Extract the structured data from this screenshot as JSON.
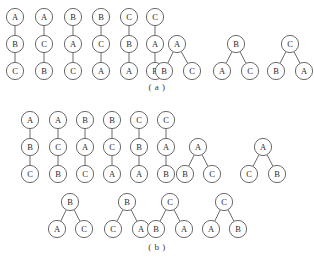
{
  "figure": {
    "node_radius": 8.6,
    "stroke_color": "#5a5a5a",
    "node_fill": "#ffffff",
    "label_color": "#2a2a2a",
    "background": "#ffffff",
    "panels": [
      {
        "id": "a",
        "caption": "( a )",
        "caption_y": 82,
        "trees": [
          {
            "name": "chain-abc",
            "shape": "chain",
            "nodes": [
              {
                "label": "A",
                "x": 15,
                "y": 17
              },
              {
                "label": "B",
                "x": 15,
                "y": 44
              },
              {
                "label": "C",
                "x": 15,
                "y": 71
              }
            ],
            "edges": [
              [
                0,
                1
              ],
              [
                1,
                2
              ]
            ]
          },
          {
            "name": "chain-acb",
            "shape": "chain",
            "nodes": [
              {
                "label": "A",
                "x": 44,
                "y": 17
              },
              {
                "label": "C",
                "x": 44,
                "y": 44
              },
              {
                "label": "B",
                "x": 44,
                "y": 71
              }
            ],
            "edges": [
              [
                0,
                1
              ],
              [
                1,
                2
              ]
            ]
          },
          {
            "name": "chain-bac",
            "shape": "chain",
            "nodes": [
              {
                "label": "B",
                "x": 73,
                "y": 17
              },
              {
                "label": "A",
                "x": 73,
                "y": 44
              },
              {
                "label": "C",
                "x": 73,
                "y": 71
              }
            ],
            "edges": [
              [
                0,
                1
              ],
              [
                1,
                2
              ]
            ]
          },
          {
            "name": "chain-bca",
            "shape": "chain",
            "nodes": [
              {
                "label": "B",
                "x": 101,
                "y": 17
              },
              {
                "label": "C",
                "x": 101,
                "y": 44
              },
              {
                "label": "A",
                "x": 101,
                "y": 71
              }
            ],
            "edges": [
              [
                0,
                1
              ],
              [
                1,
                2
              ]
            ]
          },
          {
            "name": "chain-cba",
            "shape": "chain",
            "nodes": [
              {
                "label": "C",
                "x": 129,
                "y": 17
              },
              {
                "label": "B",
                "x": 129,
                "y": 44
              },
              {
                "label": "A",
                "x": 129,
                "y": 71
              }
            ],
            "edges": [
              [
                0,
                1
              ],
              [
                1,
                2
              ]
            ]
          },
          {
            "name": "chain-cab",
            "shape": "chain",
            "nodes": [
              {
                "label": "C",
                "x": 155,
                "y": 17
              },
              {
                "label": "A",
                "x": 155,
                "y": 44
              },
              {
                "label": "B",
                "x": 155,
                "y": 71
              }
            ],
            "edges": [
              [
                0,
                1
              ],
              [
                1,
                2
              ]
            ]
          },
          {
            "name": "balanced-a-bc",
            "shape": "balanced",
            "nodes": [
              {
                "label": "A",
                "x": 177,
                "y": 44
              },
              {
                "label": "B",
                "x": 164,
                "y": 71
              },
              {
                "label": "C",
                "x": 192,
                "y": 71
              }
            ],
            "edges": [
              [
                0,
                1
              ],
              [
                0,
                2
              ]
            ]
          },
          {
            "name": "balanced-b-ac",
            "shape": "balanced",
            "nodes": [
              {
                "label": "B",
                "x": 236,
                "y": 44
              },
              {
                "label": "A",
                "x": 222,
                "y": 71
              },
              {
                "label": "C",
                "x": 250,
                "y": 71
              }
            ],
            "edges": [
              [
                0,
                1
              ],
              [
                0,
                2
              ]
            ]
          },
          {
            "name": "balanced-c-ba",
            "shape": "balanced",
            "nodes": [
              {
                "label": "C",
                "x": 290,
                "y": 44
              },
              {
                "label": "B",
                "x": 276,
                "y": 71
              },
              {
                "label": "A",
                "x": 304,
                "y": 71
              }
            ],
            "edges": [
              [
                0,
                1
              ],
              [
                0,
                2
              ]
            ]
          }
        ]
      },
      {
        "id": "b",
        "caption": "( b )",
        "caption_y": 242,
        "trees": [
          {
            "name": "chain-abc",
            "shape": "chain",
            "nodes": [
              {
                "label": "A",
                "x": 30,
                "y": 120
              },
              {
                "label": "B",
                "x": 30,
                "y": 147
              },
              {
                "label": "C",
                "x": 30,
                "y": 174
              }
            ],
            "edges": [
              [
                0,
                1
              ],
              [
                1,
                2
              ]
            ]
          },
          {
            "name": "chain-acb",
            "shape": "chain",
            "nodes": [
              {
                "label": "A",
                "x": 58,
                "y": 120
              },
              {
                "label": "C",
                "x": 58,
                "y": 147
              },
              {
                "label": "B",
                "x": 58,
                "y": 174
              }
            ],
            "edges": [
              [
                0,
                1
              ],
              [
                1,
                2
              ]
            ]
          },
          {
            "name": "chain-bac",
            "shape": "chain",
            "nodes": [
              {
                "label": "B",
                "x": 85,
                "y": 120
              },
              {
                "label": "A",
                "x": 85,
                "y": 147
              },
              {
                "label": "C",
                "x": 85,
                "y": 174
              }
            ],
            "edges": [
              [
                0,
                1
              ],
              [
                1,
                2
              ]
            ]
          },
          {
            "name": "chain-bca",
            "shape": "chain",
            "nodes": [
              {
                "label": "B",
                "x": 112,
                "y": 120
              },
              {
                "label": "C",
                "x": 112,
                "y": 147
              },
              {
                "label": "A",
                "x": 112,
                "y": 174
              }
            ],
            "edges": [
              [
                0,
                1
              ],
              [
                1,
                2
              ]
            ]
          },
          {
            "name": "chain-cba",
            "shape": "chain",
            "nodes": [
              {
                "label": "C",
                "x": 139,
                "y": 120
              },
              {
                "label": "B",
                "x": 139,
                "y": 147
              },
              {
                "label": "A",
                "x": 139,
                "y": 174
              }
            ],
            "edges": [
              [
                0,
                1
              ],
              [
                1,
                2
              ]
            ]
          },
          {
            "name": "chain-cab",
            "shape": "chain",
            "nodes": [
              {
                "label": "C",
                "x": 166,
                "y": 120
              },
              {
                "label": "A",
                "x": 166,
                "y": 147
              },
              {
                "label": "B",
                "x": 166,
                "y": 174
              }
            ],
            "edges": [
              [
                0,
                1
              ],
              [
                1,
                2
              ]
            ]
          },
          {
            "name": "balanced-a-bc",
            "shape": "balanced",
            "nodes": [
              {
                "label": "A",
                "x": 198,
                "y": 147
              },
              {
                "label": "B",
                "x": 185,
                "y": 174
              },
              {
                "label": "C",
                "x": 212,
                "y": 174
              }
            ],
            "edges": [
              [
                0,
                1
              ],
              [
                0,
                2
              ]
            ]
          },
          {
            "name": "balanced-a-cb",
            "shape": "balanced",
            "nodes": [
              {
                "label": "A",
                "x": 263,
                "y": 147
              },
              {
                "label": "C",
                "x": 249,
                "y": 174
              },
              {
                "label": "B",
                "x": 277,
                "y": 174
              }
            ],
            "edges": [
              [
                0,
                1
              ],
              [
                0,
                2
              ]
            ]
          },
          {
            "name": "balanced-b-ac",
            "shape": "balanced",
            "nodes": [
              {
                "label": "B",
                "x": 70,
                "y": 202
              },
              {
                "label": "A",
                "x": 57,
                "y": 229
              },
              {
                "label": "C",
                "x": 84,
                "y": 229
              }
            ],
            "edges": [
              [
                0,
                1
              ],
              [
                0,
                2
              ]
            ]
          },
          {
            "name": "balanced-b-ca",
            "shape": "balanced",
            "nodes": [
              {
                "label": "B",
                "x": 127,
                "y": 202
              },
              {
                "label": "C",
                "x": 113,
                "y": 229
              },
              {
                "label": "A",
                "x": 141,
                "y": 229
              }
            ],
            "edges": [
              [
                0,
                1
              ],
              [
                0,
                2
              ]
            ]
          },
          {
            "name": "balanced-c-ba",
            "shape": "balanced",
            "nodes": [
              {
                "label": "C",
                "x": 170,
                "y": 202
              },
              {
                "label": "B",
                "x": 156,
                "y": 229
              },
              {
                "label": "A",
                "x": 184,
                "y": 229
              }
            ],
            "edges": [
              [
                0,
                1
              ],
              [
                0,
                2
              ]
            ]
          },
          {
            "name": "balanced-c-ab",
            "shape": "balanced",
            "nodes": [
              {
                "label": "C",
                "x": 224,
                "y": 202
              },
              {
                "label": "A",
                "x": 211,
                "y": 229
              },
              {
                "label": "B",
                "x": 238,
                "y": 229
              }
            ],
            "edges": [
              [
                0,
                1
              ],
              [
                0,
                2
              ]
            ]
          }
        ]
      }
    ]
  },
  "chart_data": {
    "type": "diagram",
    "title": "",
    "panels": [
      {
        "label": "( a )",
        "tree_count": 9,
        "trees": [
          {
            "root": "A",
            "structure": "chain",
            "sequence": [
              "A",
              "B",
              "C"
            ]
          },
          {
            "root": "A",
            "structure": "chain",
            "sequence": [
              "A",
              "C",
              "B"
            ]
          },
          {
            "root": "B",
            "structure": "chain",
            "sequence": [
              "B",
              "A",
              "C"
            ]
          },
          {
            "root": "B",
            "structure": "chain",
            "sequence": [
              "B",
              "C",
              "A"
            ]
          },
          {
            "root": "C",
            "structure": "chain",
            "sequence": [
              "C",
              "B",
              "A"
            ]
          },
          {
            "root": "C",
            "structure": "chain",
            "sequence": [
              "C",
              "A",
              "B"
            ]
          },
          {
            "root": "A",
            "structure": "balanced",
            "left": "B",
            "right": "C"
          },
          {
            "root": "B",
            "structure": "balanced",
            "left": "A",
            "right": "C"
          },
          {
            "root": "C",
            "structure": "balanced",
            "left": "B",
            "right": "A"
          }
        ]
      },
      {
        "label": "( b )",
        "tree_count": 12,
        "trees": [
          {
            "root": "A",
            "structure": "chain",
            "sequence": [
              "A",
              "B",
              "C"
            ]
          },
          {
            "root": "A",
            "structure": "chain",
            "sequence": [
              "A",
              "C",
              "B"
            ]
          },
          {
            "root": "B",
            "structure": "chain",
            "sequence": [
              "B",
              "A",
              "C"
            ]
          },
          {
            "root": "B",
            "structure": "chain",
            "sequence": [
              "B",
              "C",
              "A"
            ]
          },
          {
            "root": "C",
            "structure": "chain",
            "sequence": [
              "C",
              "B",
              "A"
            ]
          },
          {
            "root": "C",
            "structure": "chain",
            "sequence": [
              "C",
              "A",
              "B"
            ]
          },
          {
            "root": "A",
            "structure": "balanced",
            "left": "B",
            "right": "C"
          },
          {
            "root": "A",
            "structure": "balanced",
            "left": "C",
            "right": "B"
          },
          {
            "root": "B",
            "structure": "balanced",
            "left": "A",
            "right": "C"
          },
          {
            "root": "B",
            "structure": "balanced",
            "left": "C",
            "right": "A"
          },
          {
            "root": "C",
            "structure": "balanced",
            "left": "B",
            "right": "A"
          },
          {
            "root": "C",
            "structure": "balanced",
            "left": "A",
            "right": "B"
          }
        ]
      }
    ],
    "node_labels": [
      "A",
      "B",
      "C"
    ]
  }
}
